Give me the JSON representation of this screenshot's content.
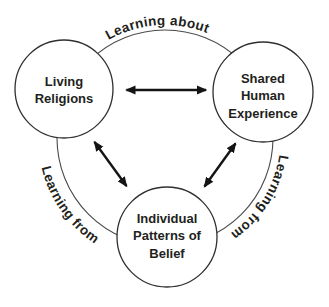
{
  "diagram": {
    "colors": {
      "background": "#ffffff",
      "circle_stroke": "#2f2f2f",
      "outer_circle_stroke": "#4a4a4a",
      "arrow": "#141414",
      "text": "#231f20"
    },
    "nodes": [
      {
        "id": "living-religions",
        "lines": [
          "Living",
          "Religions"
        ]
      },
      {
        "id": "shared-human-experience",
        "lines": [
          "Shared",
          "Human",
          "Experience"
        ]
      },
      {
        "id": "individual-patterns-of-belief",
        "lines": [
          "Individual",
          "Patterns of",
          "Belief"
        ]
      }
    ],
    "arc_labels": {
      "top": "Learning about",
      "bottom_left": "Learning from",
      "right": "Learning from"
    },
    "edges": [
      {
        "from": "living-religions",
        "to": "shared-human-experience",
        "type": "double-arrow"
      },
      {
        "from": "living-religions",
        "to": "individual-patterns-of-belief",
        "type": "double-arrow"
      },
      {
        "from": "shared-human-experience",
        "to": "individual-patterns-of-belief",
        "type": "double-arrow"
      }
    ]
  }
}
